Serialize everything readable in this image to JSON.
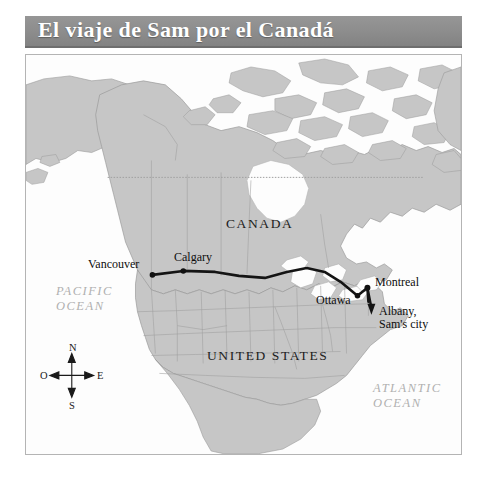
{
  "header": {
    "title": "El viaje de Sam por el Canadá",
    "background_color": "#8c8c8c",
    "text_color": "#ffffff"
  },
  "map": {
    "land_color": "#c6c6c6",
    "water_color": "#fdfdfd",
    "border_color": "#8f8f8f",
    "route_color": "#141414",
    "frame_color": "#b4b4b4",
    "countries": [
      {
        "name": "CANADA",
        "x": 200,
        "y": 168
      },
      {
        "name": "UNITED STATES",
        "x": 181,
        "y": 300
      }
    ],
    "oceans": [
      {
        "line1": "PACIFIC",
        "line2": "OCEAN",
        "x": 30,
        "y": 236
      },
      {
        "line1": "ATLANTIC",
        "line2": "OCEAN",
        "x": 347,
        "y": 332
      }
    ],
    "cities": [
      {
        "name": "Vancouver",
        "label_x": 64,
        "label_y": 202,
        "dot_x": 127,
        "dot_y": 221
      },
      {
        "name": "Calgary",
        "label_x": 150,
        "label_y": 196,
        "dot_x": 158,
        "dot_y": 217
      },
      {
        "name": "Ottawa",
        "label_x": 292,
        "label_y": 240,
        "dot_x": 333,
        "dot_y": 242
      },
      {
        "name": "Montreal",
        "label_x": 343,
        "label_y": 222,
        "dot_x": 343,
        "dot_y": 234
      },
      {
        "name": "Albany,",
        "name2": "Sam's city",
        "label_x": 351,
        "label_y": 252,
        "dot_x": 347,
        "dot_y": 258
      }
    ],
    "compass": {
      "north": "N",
      "south": "S",
      "east": "E",
      "west": "O",
      "center_x": 46,
      "center_y": 322
    },
    "arctic_circle": {
      "label": "",
      "y": 123
    }
  }
}
